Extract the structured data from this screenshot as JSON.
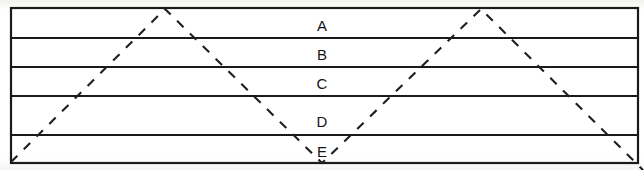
{
  "figure": {
    "name": "banded-rectangle-with-dashed-zigzag",
    "colors": {
      "line": "#1a1a1a",
      "dashed_line": "#1e1e1e",
      "background": "#fdfdfc",
      "label_text": "#141414"
    },
    "frame": {
      "left": 11,
      "top": 8,
      "right": 638,
      "bottom": 163,
      "border_width": 2
    },
    "band_labels": [
      {
        "text": "A",
        "x": 322,
        "y": 26
      },
      {
        "text": "B",
        "x": 322,
        "y": 55
      },
      {
        "text": "C",
        "x": 322,
        "y": 84
      },
      {
        "text": "D",
        "x": 322,
        "y": 122
      },
      {
        "text": "E",
        "x": 322,
        "y": 152
      }
    ],
    "separator_lines_y": [
      38,
      67,
      96,
      135
    ],
    "dashed_path": {
      "dash_pattern": "9 9",
      "stroke_width": 2,
      "points": [
        {
          "x": 11,
          "y": 162
        },
        {
          "x": 165,
          "y": 9
        },
        {
          "x": 322,
          "y": 163
        },
        {
          "x": 481,
          "y": 9
        },
        {
          "x": 643,
          "y": 170
        }
      ]
    }
  }
}
